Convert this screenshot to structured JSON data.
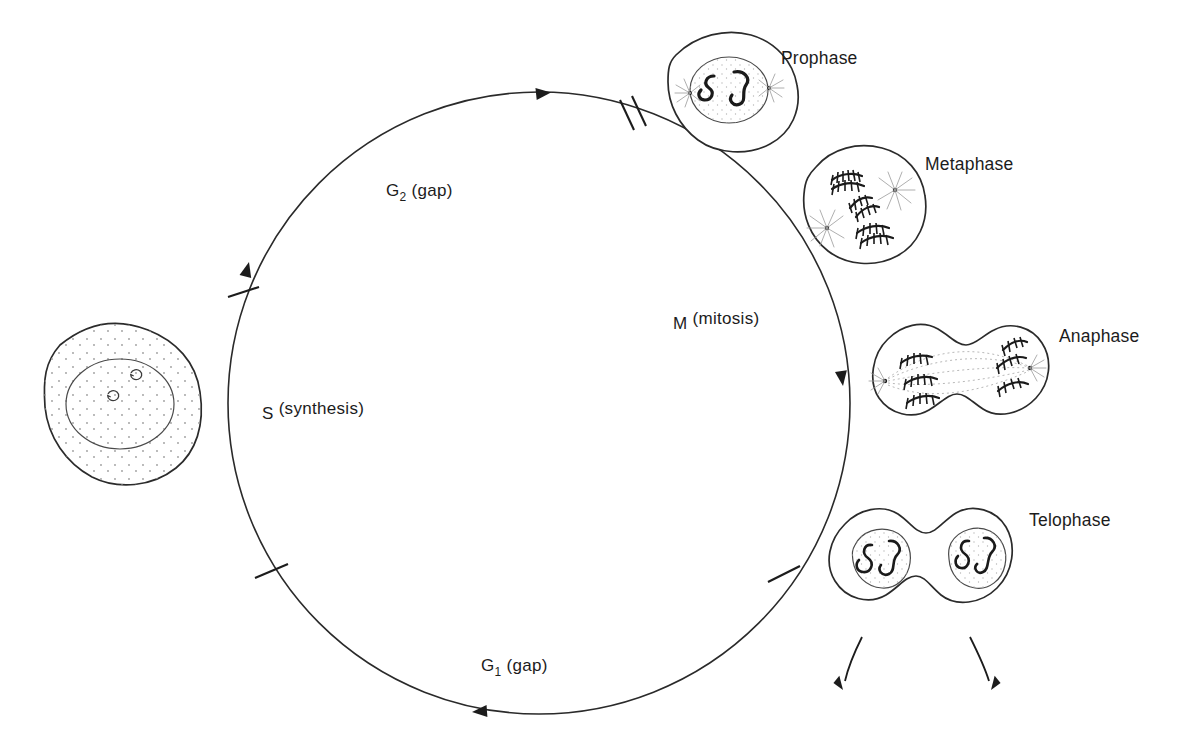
{
  "figure": {
    "background_color": "#ffffff",
    "line_color": "#2a2a2a",
    "text_color": "#1c1c1c"
  },
  "cycle": {
    "center": {
      "x": 539,
      "y": 403
    },
    "radius": 311,
    "direction": "clockwise",
    "phases": [
      {
        "id": "g2",
        "label_main": "G",
        "label_sub": "2",
        "label_rest": " (gap)",
        "label_full": "G2 (gap)",
        "x": 428,
        "y": 190
      },
      {
        "id": "m",
        "label_main": "M",
        "label_sub": "",
        "label_rest": " (mitosis)",
        "label_full": "M (mitosis)",
        "x": 673,
        "y": 323
      },
      {
        "id": "s",
        "label_main": "S",
        "label_sub": "",
        "label_rest": " (synthesis)",
        "label_full": "S (synthesis)",
        "x": 262,
        "y": 413
      },
      {
        "id": "g1",
        "label_main": "G",
        "label_sub": "1",
        "label_rest": " (gap)",
        "label_full": "G1 (gap)",
        "x": 481,
        "y": 665
      }
    ],
    "boundary_ticks": [
      {
        "id": "g2-m-boundary",
        "type": "double",
        "angle_deg": -73,
        "note": "G2 / M boundary, double tick"
      },
      {
        "id": "s-g2-boundary",
        "type": "single",
        "angle_deg": 205,
        "note": "S / G2 boundary"
      },
      {
        "id": "g1-s-boundary",
        "type": "single",
        "angle_deg": 150,
        "note": "G1 / S boundary"
      },
      {
        "id": "m-g1-boundary",
        "type": "single",
        "angle_deg": 31,
        "note": "M / G1 boundary"
      }
    ],
    "arrowheads": [
      {
        "id": "arrow-top",
        "direction": "right",
        "angle_deg": -100
      },
      {
        "id": "arrow-right",
        "direction": "down",
        "angle_deg": -3
      },
      {
        "id": "arrow-bottom",
        "direction": "left",
        "angle_deg": 87
      },
      {
        "id": "arrow-left",
        "direction": "up",
        "angle_deg": 207
      }
    ]
  },
  "cells": [
    {
      "id": "interphase-cell",
      "name": "interphase-cell",
      "label": "",
      "label_x": 0,
      "label_y": 0,
      "center": {
        "x": 125,
        "y": 405
      },
      "features": [
        "cytoplasm-stipple",
        "nucleus",
        "two-nucleoli"
      ]
    },
    {
      "id": "prophase-cell",
      "name": "prophase-cell",
      "label": "Prophase",
      "label_x": 781,
      "label_y": 64,
      "center": {
        "x": 723,
        "y": 92
      },
      "features": [
        "nuclear-envelope",
        "condensing-chromosomes",
        "two-centrosomes-with-asters"
      ]
    },
    {
      "id": "metaphase-cell",
      "name": "metaphase-cell",
      "label": "Metaphase",
      "label_x": 925,
      "label_y": 170,
      "center": {
        "x": 862,
        "y": 206
      },
      "features": [
        "metaphase-plate-chromosomes",
        "two-spindle-poles-with-asters"
      ]
    },
    {
      "id": "anaphase-cell",
      "name": "anaphase-cell",
      "label": "Anaphase",
      "label_x": 1059,
      "label_y": 342,
      "center": {
        "x": 951,
        "y": 385
      },
      "features": [
        "separating-chromatids",
        "spindle-fibers",
        "two-poles",
        "cleavage-furrow"
      ]
    },
    {
      "id": "telophase-cell",
      "name": "telophase-cell",
      "label": "Telophase",
      "label_x": 1029,
      "label_y": 526,
      "center": {
        "x": 921,
        "y": 570
      },
      "features": [
        "two-daughter-nuclei",
        "decondensing-chromosomes",
        "deep-cleavage-furrow"
      ]
    }
  ],
  "daughter_arrows": [
    {
      "id": "daughter-arrow-left",
      "from": {
        "x": 855,
        "y": 640
      },
      "to": {
        "x": 845,
        "y": 690
      }
    },
    {
      "id": "daughter-arrow-right",
      "from": {
        "x": 973,
        "y": 640
      },
      "to": {
        "x": 990,
        "y": 690
      }
    }
  ]
}
